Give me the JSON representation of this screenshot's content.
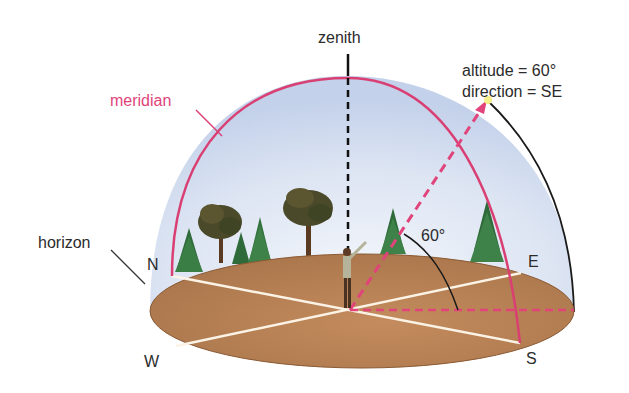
{
  "diagram": {
    "labels": {
      "zenith": "zenith",
      "meridian": "meridian",
      "horizon": "horizon",
      "north": "N",
      "south": "S",
      "east": "E",
      "west": "W",
      "angle": "60°",
      "altitude_line": "altitude = 60°",
      "direction_line": "direction = SE"
    },
    "colors": {
      "sky": "#c9d6ec",
      "sky_center": "#eef2fa",
      "ground": "#b07a4e",
      "ground_light": "#c99468",
      "meridian": "#d93f72",
      "pointer": "#e0447a",
      "lines": "#fbf3e6",
      "text": "#2b2b2b",
      "star": "#f5f08a"
    },
    "values": {
      "altitude_deg": 60,
      "direction": "SE"
    }
  }
}
